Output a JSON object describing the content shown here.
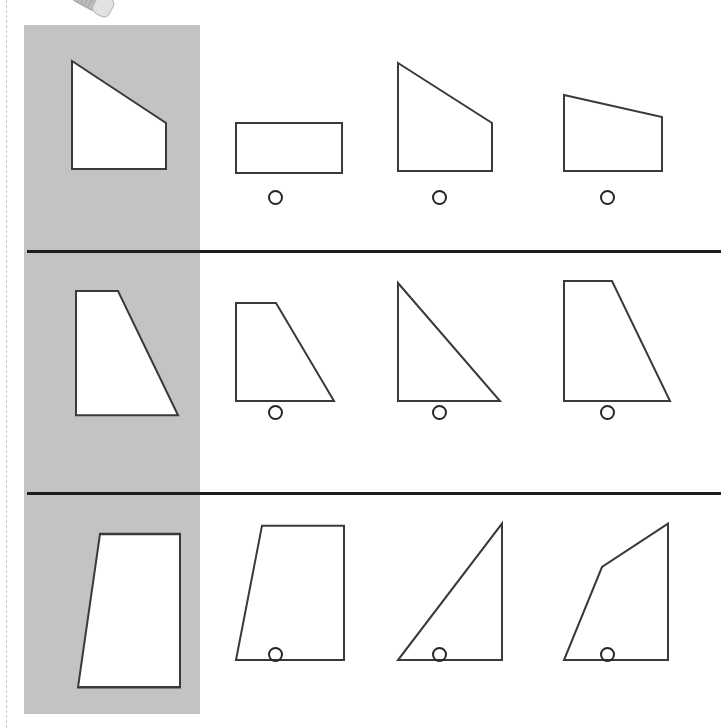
{
  "worksheet": {
    "title": "Shape matching multiple choice worksheet",
    "type": "shape-match-quiz",
    "page_edge": "dashed-page-boundary",
    "reference_column_color": "#c3c3c3",
    "shape_stroke_color": "#3a3a3a",
    "shape_fill_color": "#ffffff",
    "separator_color": "#1d1d1d",
    "artifact_label": "glue-stick-photo-fragment"
  },
  "rows": [
    {
      "id": "row-1",
      "reference": {
        "name": "right trapezoid sloping down to the right",
        "label": "reference-shape-row-1",
        "viewbox": "0 0 150 130",
        "points": "28,10 122,72 122,118 28,118",
        "x": 20,
        "y": 26,
        "width": 150,
        "height": 130
      },
      "options": [
        {
          "label": "option-a",
          "shape_name": "rectangle",
          "viewbox": "0 0 130 130",
          "points": "14,72 120,72 120,122 14,122",
          "x": 12,
          "y": 26,
          "width": 130,
          "height": 130,
          "radio_x": 58,
          "radio_y": 165,
          "selected": false
        },
        {
          "label": "option-b",
          "shape_name": "right trapezoid sloping down to the right",
          "viewbox": "0 0 130 130",
          "points": "14,12 108,72 108,120 14,120",
          "x": 12,
          "y": 26,
          "width": 130,
          "height": 130,
          "radio_x": 60,
          "radio_y": 165,
          "selected": false
        },
        {
          "label": "option-c",
          "shape_name": "shallow trapezoid sloping down to the right",
          "viewbox": "0 0 130 130",
          "points": "14,44 112,66 112,120 14,120",
          "x": 12,
          "y": 26,
          "width": 130,
          "height": 130,
          "radio_x": 62,
          "radio_y": 165,
          "selected": false
        }
      ]
    },
    {
      "id": "row-2",
      "reference": {
        "name": "right trapezoid with steep right slope",
        "label": "reference-shape-row-2",
        "viewbox": "0 0 150 140",
        "points": "32,28 74,28 134,144 32,144",
        "x": 20,
        "y": 8,
        "width": 150,
        "height": 150
      },
      "options": [
        {
          "label": "option-a",
          "shape_name": "right trapezoid with steep right slope",
          "viewbox": "0 0 130 140",
          "points": "14,28 54,28 112,126 14,126",
          "x": 12,
          "y": 22,
          "width": 130,
          "height": 140,
          "radio_x": 58,
          "radio_y": 152,
          "selected": false
        },
        {
          "label": "option-b",
          "shape_name": "right triangle, right angle bottom-left",
          "viewbox": "0 0 130 140",
          "points": "14,8 116,126 14,126",
          "x": 12,
          "y": 22,
          "width": 130,
          "height": 140,
          "radio_x": 60,
          "radio_y": 152,
          "selected": false
        },
        {
          "label": "option-c",
          "shape_name": "right trapezoid with steep right slope",
          "viewbox": "0 0 130 140",
          "points": "14,6 62,6 120,126 14,126",
          "x": 12,
          "y": 22,
          "width": 130,
          "height": 140,
          "radio_x": 62,
          "radio_y": 152,
          "selected": false
        }
      ]
    },
    {
      "id": "row-3",
      "reference": {
        "name": "trapezoid with slanted left side and vertical right side",
        "label": "reference-shape-row-3",
        "viewbox": "0 0 150 140",
        "points": "56,28 136,28 136,158 34,158",
        "x": 20,
        "y": 6,
        "width": 150,
        "height": 165
      },
      "options": [
        {
          "label": "option-a",
          "shape_name": "trapezoid with slanted left side and vertical right side",
          "viewbox": "0 0 130 150",
          "points": "40,20 122,20 122,150 14,150",
          "x": 12,
          "y": 10,
          "width": 130,
          "height": 155,
          "radio_x": 58,
          "radio_y": 152,
          "selected": false
        },
        {
          "label": "option-b",
          "shape_name": "right triangle, right angle bottom-right",
          "viewbox": "0 0 130 150",
          "points": "118,18 118,150 14,150",
          "x": 12,
          "y": 10,
          "width": 130,
          "height": 155,
          "radio_x": 60,
          "radio_y": 152,
          "selected": false
        },
        {
          "label": "option-c",
          "shape_name": "irregular pentagon with bent left edge",
          "viewbox": "0 0 130 150",
          "points": "118,18 52,60 14,150 118,150",
          "x": 12,
          "y": 10,
          "width": 130,
          "height": 155,
          "radio_x": 62,
          "radio_y": 152,
          "selected": false
        }
      ]
    }
  ]
}
